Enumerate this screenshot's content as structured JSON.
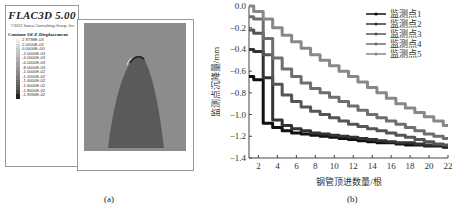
{
  "panel_a": {
    "title": "FLAC3D 5.00",
    "copyright": "©2012 Itasca Consulting Group, Inc.",
    "contour_label": "Contour Of Z-Displacement",
    "contour_values": [
      "2.9798E-03",
      "2.0000E-03",
      "0.0000E+00",
      "-2.0000E-03",
      "-4.0000E-03",
      "-6.0000E-03",
      "-8.0000E-03",
      "-1.0000E-02",
      "-1.2000E-02",
      "-1.4000E-02",
      "-1.6000E-02",
      "-1.8000E-02",
      "-1.9394E-02"
    ],
    "colors": [
      "#e8e8e8",
      "#d8d8d8",
      "#c8c8c8",
      "#bdbdbd",
      "#b0b0b0",
      "#a2a2a2",
      "#959595",
      "#888888",
      "#7a7a7a",
      "#6b6b6b",
      "#5a5a5a",
      "#444444",
      "#222222"
    ],
    "caption": "(a)"
  },
  "panel_b": {
    "caption": "(b)"
  },
  "chart_data": {
    "type": "line",
    "title": "",
    "xlabel": "钢管顶进数量/根",
    "ylabel": "监测点沉降量/mm",
    "xlim": [
      1,
      22
    ],
    "ylim": [
      -1.4,
      0.0
    ],
    "xticks": [
      2,
      4,
      6,
      8,
      10,
      12,
      14,
      16,
      18,
      20,
      22
    ],
    "yticks": [
      "0.0",
      "-0.2",
      "-0.4",
      "-0.6",
      "-0.8",
      "-1.0",
      "-1.2",
      "-1.4"
    ],
    "grid": false,
    "legend_position": "upper right",
    "x": [
      1,
      2,
      3,
      4,
      5,
      6,
      7,
      8,
      9,
      10,
      11,
      12,
      13,
      14,
      15,
      16,
      17,
      18,
      19,
      20,
      21,
      22
    ],
    "series": [
      {
        "name": "监测点1",
        "color": "#111111",
        "values": [
          -0.65,
          -0.68,
          -1.08,
          -1.12,
          -1.15,
          -1.17,
          -1.18,
          -1.19,
          -1.2,
          -1.21,
          -1.22,
          -1.23,
          -1.24,
          -1.25,
          -1.26,
          -1.26,
          -1.27,
          -1.28,
          -1.28,
          -1.29,
          -1.29,
          -1.3
        ]
      },
      {
        "name": "监测点2",
        "color": "#333333",
        "values": [
          -0.4,
          -0.42,
          -0.66,
          -1.05,
          -1.1,
          -1.13,
          -1.15,
          -1.17,
          -1.18,
          -1.19,
          -1.2,
          -1.21,
          -1.22,
          -1.23,
          -1.24,
          -1.25,
          -1.26,
          -1.26,
          -1.27,
          -1.28,
          -1.28,
          -1.29
        ]
      },
      {
        "name": "监测点3",
        "color": "#555555",
        "values": [
          -0.22,
          -0.25,
          -0.45,
          -0.72,
          -0.82,
          -0.88,
          -0.93,
          -0.97,
          -1.0,
          -1.03,
          -1.06,
          -1.09,
          -1.11,
          -1.13,
          -1.15,
          -1.17,
          -1.19,
          -1.21,
          -1.23,
          -1.25,
          -1.27,
          -1.28
        ]
      },
      {
        "name": "监测点4",
        "color": "#6e6e6e",
        "values": [
          -0.1,
          -0.12,
          -0.3,
          -0.48,
          -0.58,
          -0.65,
          -0.71,
          -0.76,
          -0.8,
          -0.84,
          -0.88,
          -0.92,
          -0.96,
          -1.0,
          -1.03,
          -1.06,
          -1.09,
          -1.12,
          -1.15,
          -1.18,
          -1.2,
          -1.22
        ]
      },
      {
        "name": "监测点5",
        "color": "#888888",
        "values": [
          0.0,
          -0.05,
          -0.12,
          -0.2,
          -0.27,
          -0.33,
          -0.39,
          -0.45,
          -0.5,
          -0.55,
          -0.6,
          -0.65,
          -0.7,
          -0.75,
          -0.8,
          -0.85,
          -0.9,
          -0.94,
          -0.98,
          -1.02,
          -1.06,
          -1.1
        ]
      }
    ]
  }
}
